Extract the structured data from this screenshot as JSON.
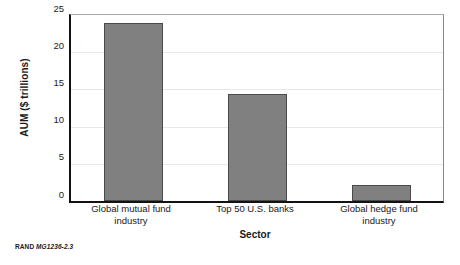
{
  "chart_data": {
    "type": "bar",
    "title": "",
    "subtitle": "",
    "xlabel": "Sector",
    "ylabel": "AUM ($ trillions)",
    "categories": [
      "Global mutual fund industry",
      "Top 50 U.S. banks",
      "Global hedge fund industry"
    ],
    "values": [
      23.9,
      14.4,
      2.2
    ],
    "ylim": [
      0,
      25
    ],
    "yticks": [
      0,
      5,
      10,
      15,
      20,
      25
    ],
    "ytick_labels": [
      "0",
      "5",
      "10",
      "15",
      "20",
      "25"
    ],
    "grid": true,
    "grid_axis": "y",
    "legend": false,
    "legend_position": "none",
    "bar_color": "#808080",
    "bar_edge_color": "#4a4a4a",
    "axis_color": "#121212",
    "gridline_color": "#e8e8e8",
    "plot_background": "#ffffff"
  },
  "figure": {
    "y_axis_title": "AUM ($ trillions)",
    "x_axis_title": "Sector",
    "category_labels": [
      "Global mutual fund\nindustry",
      "Top 50 U.S. banks",
      "Global hedge fund\nindustry"
    ],
    "category_label_lines": [
      [
        "Global mutual fund",
        "industry"
      ],
      [
        "Top 50 U.S. banks",
        ""
      ],
      [
        "Global hedge fund",
        "industry"
      ]
    ]
  },
  "footnote": {
    "brand": "RAND",
    "figure_id": "MG1236-2.3"
  }
}
